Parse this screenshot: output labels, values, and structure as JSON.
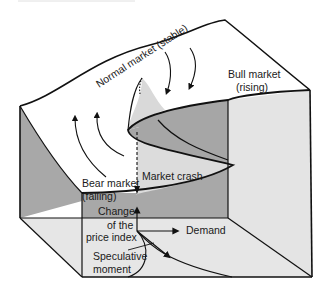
{
  "diagram": {
    "type": "cusp-catastrophe-surface",
    "labels": {
      "normal_market": "Normal market (stable)",
      "bull_market_line1": "Bull market",
      "bull_market_line2": "(rising)",
      "bear_market_line1": "Bear market",
      "bear_market_line2": "(falling)",
      "market_crash": "Market crash",
      "axis_price_line1": "Change",
      "axis_price_line2": "of the",
      "axis_price_line3": "price index",
      "axis_demand": "Demand",
      "axis_speculative_line1": "Speculative",
      "axis_speculative_line2": "moment"
    },
    "colors": {
      "surface_top": "#ffffff",
      "fold_light": "#d9d9d9",
      "fold_dark": "#a6a6a6",
      "side_dark": "#a8a8a8",
      "side_light": "#e2e2e2",
      "floor": "#e6e6e6",
      "line": "#111111"
    }
  }
}
